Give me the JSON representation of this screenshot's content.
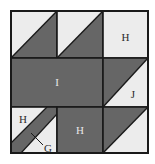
{
  "figure": {
    "colors": {
      "background": "#ffffff",
      "light_fill": "#ececec",
      "dark_fill": "#666666",
      "outline": "#1a1a1a",
      "label_on_light": "#2b2b2b",
      "label_on_dark": "#e8e8e8",
      "leader_line": "#1a1a1a"
    },
    "grid": {
      "rows": 3,
      "columns": 3,
      "left": 11,
      "top": 11,
      "cell_width": 46,
      "cell_height": 47
    },
    "cells": [
      {
        "id": "cell-r1c1",
        "row": 1,
        "column": 1,
        "pattern": "half-square-triangle",
        "diagonal": "top-left-to-bottom-right",
        "upper_fill": "light",
        "lower_fill": "dark",
        "label": ""
      },
      {
        "id": "cell-r1c2",
        "row": 1,
        "column": 2,
        "pattern": "half-square-triangle",
        "diagonal": "top-left-to-bottom-right",
        "upper_fill": "light",
        "lower_fill": "dark",
        "label": ""
      },
      {
        "id": "cell-r1c3",
        "row": 1,
        "column": 3,
        "pattern": "solid",
        "fill": "light",
        "label": "H"
      },
      {
        "id": "cell-r2c1c2",
        "row": 2,
        "column": 1,
        "pattern": "solid-rectangle-span",
        "span_columns": 2,
        "fill": "dark",
        "label": "I"
      },
      {
        "id": "cell-r2c3",
        "row": 2,
        "column": 3,
        "pattern": "half-square-triangle",
        "diagonal": "top-left-to-bottom-right",
        "upper_fill": "dark",
        "lower_fill": "light",
        "label": "J"
      },
      {
        "id": "cell-r3c1",
        "row": 3,
        "column": 1,
        "pattern": "diagonal-band",
        "band_direction": "bottom-left-to-top-right",
        "background_fill": "light",
        "band_fill": "dark",
        "label": "H",
        "callout_label": "G"
      },
      {
        "id": "cell-r3c2",
        "row": 3,
        "column": 2,
        "pattern": "solid",
        "fill": "dark",
        "label": "H"
      },
      {
        "id": "cell-r3c3",
        "row": 3,
        "column": 3,
        "pattern": "half-square-triangle",
        "diagonal": "top-left-to-bottom-right",
        "upper_fill": "dark",
        "lower_fill": "light",
        "label": ""
      }
    ],
    "labels": {
      "h_top_right": "H",
      "i_center": "I",
      "j_middle_right": "J",
      "h_bottom_left": "H",
      "g_callout": "G",
      "h_bottom_middle": "H"
    }
  }
}
